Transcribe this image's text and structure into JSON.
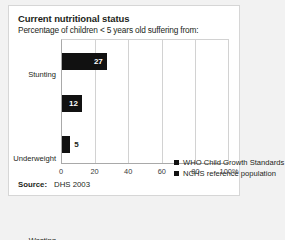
{
  "figure": {
    "title": "Current nutritional status",
    "subtitle": "Percentage of children < 5 years old suffering from:",
    "source_label": "Source:",
    "source_value": "DHS 2003"
  },
  "chart_data": {
    "type": "bar",
    "orientation": "horizontal",
    "title": "Current nutritional status",
    "subtitle": "Percentage of children < 5 years old suffering from:",
    "categories": [
      "Stunting",
      "Underweight",
      "Wasting"
    ],
    "values": [
      27,
      12,
      5
    ],
    "data_labels": [
      "27",
      "12",
      "5"
    ],
    "series": [
      {
        "name": "WHO Child Growth Standards",
        "values": [
          27,
          12,
          5
        ],
        "color": "#111111"
      }
    ],
    "legend": [
      {
        "label": "WHO Child Growth Standards",
        "color": "#111111"
      },
      {
        "label": "NCHS reference population",
        "color": "#111111"
      }
    ],
    "legend_position": "inside-center-right",
    "xlabel": "",
    "ylabel": "",
    "xlim": [
      0,
      100
    ],
    "xticks": [
      0,
      20,
      40,
      60,
      80,
      100
    ],
    "xtick_labels": [
      "0",
      "20",
      "40",
      "60",
      "80",
      "100%"
    ],
    "grid": "vertical",
    "bar_color": "#111111",
    "source": "Source: DHS 2003"
  }
}
